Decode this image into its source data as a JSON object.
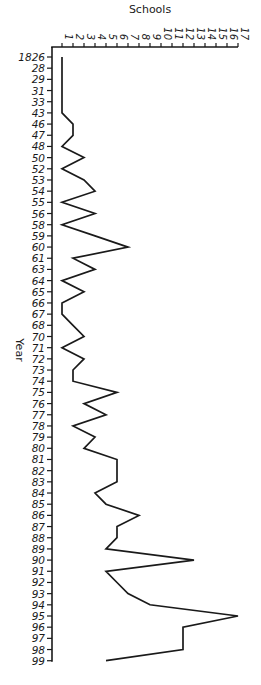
{
  "chart_data": {
    "type": "line",
    "orientation": "vertical-category-axis",
    "title": "",
    "xlabel": "Schools",
    "ylabel": "Year",
    "xlim": [
      1,
      17
    ],
    "x_ticks": [
      1,
      2,
      3,
      4,
      5,
      6,
      7,
      8,
      9,
      10,
      11,
      12,
      13,
      14,
      15,
      16,
      17
    ],
    "grid": false,
    "legend": null,
    "categories": [
      "1826",
      "28",
      "29",
      "31",
      "33",
      "43",
      "46",
      "47",
      "48",
      "50",
      "52",
      "53",
      "54",
      "55",
      "56",
      "58",
      "59",
      "60",
      "61",
      "63",
      "64",
      "65",
      "66",
      "67",
      "68",
      "70",
      "71",
      "72",
      "73",
      "74",
      "75",
      "76",
      "77",
      "78",
      "79",
      "80",
      "81",
      "82",
      "83",
      "84",
      "85",
      "86",
      "87",
      "88",
      "89",
      "90",
      "91",
      "92",
      "93",
      "94",
      "95",
      "96",
      "97",
      "98",
      "99"
    ],
    "series": [
      {
        "name": "Schools",
        "values": [
          1,
          1,
          1,
          1,
          1,
          1,
          2,
          2,
          1,
          3,
          1,
          3,
          4,
          1,
          4,
          1,
          4,
          7,
          2,
          4,
          1,
          3,
          1,
          1,
          2,
          3,
          1,
          3,
          2,
          2,
          6,
          3,
          5,
          2,
          4,
          3,
          6,
          6,
          6,
          4,
          5,
          8,
          6,
          6,
          5,
          13,
          5,
          6,
          7,
          9,
          17,
          12,
          12,
          12,
          5
        ]
      }
    ],
    "color": "#1a1a1a"
  },
  "labels": {
    "x_axis_title": "Schools",
    "y_axis_title": "Year"
  }
}
